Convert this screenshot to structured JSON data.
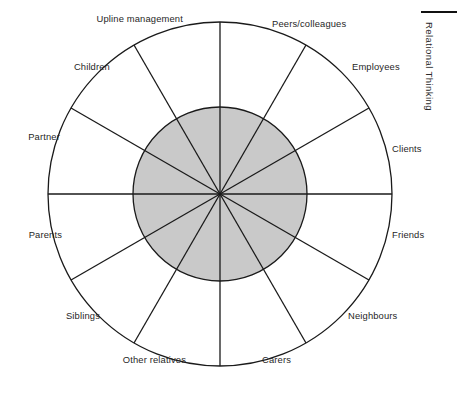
{
  "page": {
    "running_head": "Relational Thinking"
  },
  "diagram": {
    "name": "relational-wheel",
    "center_x": 220,
    "center_y": 194,
    "outer_radius": 172,
    "inner_radius": 87,
    "sector_count": 12,
    "colors": {
      "inner_fill": "#c9c9c9",
      "outer_fill": "#ffffff",
      "stroke": "#1a1a1a"
    },
    "sectors": [
      {
        "label": "Peers/colleagues",
        "mid_angle_deg": 15,
        "label_x": 272,
        "label_y": 24,
        "align": "left"
      },
      {
        "label": "Employees",
        "mid_angle_deg": 45,
        "label_x": 352,
        "label_y": 67,
        "align": "left"
      },
      {
        "label": "Clients",
        "mid_angle_deg": 75,
        "label_x": 392,
        "label_y": 149,
        "align": "left"
      },
      {
        "label": "Friends",
        "mid_angle_deg": 105,
        "label_x": 392,
        "label_y": 235,
        "align": "left"
      },
      {
        "label": "Neighbours",
        "mid_angle_deg": 135,
        "label_x": 348,
        "label_y": 316,
        "align": "left"
      },
      {
        "label": "Carers",
        "mid_angle_deg": 165,
        "label_x": 262,
        "label_y": 360,
        "align": "left"
      },
      {
        "label": "Other relatives",
        "mid_angle_deg": 195,
        "label_x": 186,
        "label_y": 360,
        "align": "right"
      },
      {
        "label": "Siblings",
        "mid_angle_deg": 225,
        "label_x": 100,
        "label_y": 316,
        "align": "right"
      },
      {
        "label": "Parents",
        "mid_angle_deg": 255,
        "label_x": 62,
        "label_y": 235,
        "align": "right"
      },
      {
        "label": "Partner",
        "mid_angle_deg": 285,
        "label_x": 60,
        "label_y": 137,
        "align": "right"
      },
      {
        "label": "Children",
        "mid_angle_deg": 315,
        "label_x": 110,
        "label_y": 67,
        "align": "right"
      },
      {
        "label": "Upline management",
        "mid_angle_deg": 345,
        "label_x": 183,
        "label_y": 19,
        "align": "right"
      }
    ]
  }
}
